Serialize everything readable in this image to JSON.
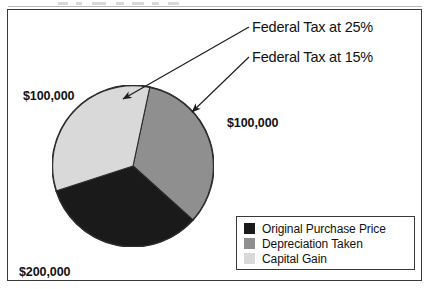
{
  "figure": {
    "background_color": "#ffffff",
    "border_color": "#3a3a3a"
  },
  "chart_data": {
    "type": "pie",
    "title": "",
    "legend_position": "bottom-right",
    "categories": [
      "Original Purchase Price",
      "Depreciation Taken",
      "Capital Gain"
    ],
    "values": [
      200000,
      100000,
      100000
    ],
    "value_labels": [
      "$200,000",
      "$100,000",
      "$100,000"
    ],
    "colors": [
      "#1a1a1a",
      "#8f8f8f",
      "#d9d9d9"
    ],
    "slices": [
      {
        "name": "Original Purchase Price",
        "value": 200000,
        "value_label": "$200,000",
        "color": "#1a1a1a",
        "start_angle_deg": 132,
        "end_angle_deg": 252,
        "label_position": "lower-left"
      },
      {
        "name": "Depreciation Taken",
        "value": 100000,
        "value_label": "$100,000",
        "color": "#8f8f8f",
        "start_angle_deg": 12,
        "end_angle_deg": 132,
        "label_position": "upper-left",
        "annotation": "Federal Tax at 25%"
      },
      {
        "name": "Capital Gain",
        "value": 100000,
        "value_label": "$100,000",
        "color": "#d9d9d9",
        "start_angle_deg": 252,
        "end_angle_deg": 372,
        "label_position": "right",
        "annotation": "Federal Tax at 15%"
      }
    ]
  },
  "labels": {
    "depreciation_value": "$100,000",
    "capital_gain_value": "$100,000",
    "original_price_value": "$200,000"
  },
  "callouts": [
    {
      "id": "federal-tax-25",
      "text": "Federal Tax at 25%",
      "points_to": "Depreciation Taken"
    },
    {
      "id": "federal-tax-15",
      "text": "Federal Tax at 15%",
      "points_to": "Capital Gain"
    }
  ],
  "legend": {
    "items": [
      {
        "label": "Original Purchase Price",
        "color": "#1a1a1a"
      },
      {
        "label": "Depreciation Taken",
        "color": "#8f8f8f"
      },
      {
        "label": "Capital Gain",
        "color": "#d9d9d9"
      }
    ]
  }
}
